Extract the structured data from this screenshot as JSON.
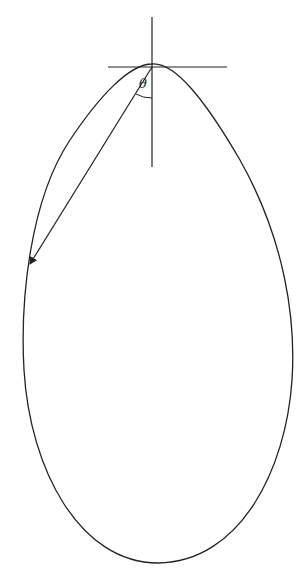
{
  "diagram": {
    "labels": {
      "angle": "θ"
    },
    "stroke_color": "#222222",
    "background": "#ffffff"
  }
}
